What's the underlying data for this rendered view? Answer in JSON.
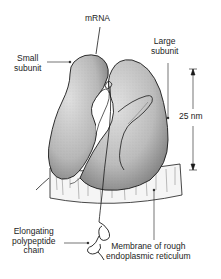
{
  "diagram": {
    "labels": {
      "mrna": "mRNA",
      "small_subunit_line1": "Small",
      "small_subunit_line2": "subunit",
      "large_subunit_line1": "Large",
      "large_subunit_line2": "subunit",
      "scale": "25 nm",
      "polypeptide_line1": "Elongating",
      "polypeptide_line2": "polypeptide",
      "polypeptide_line3": "chain",
      "membrane_line1": "Membrane of rough",
      "membrane_line2": "endoplasmic reticulum"
    },
    "colors": {
      "ink": "#1a1a1a",
      "subunit_fill": "#c9c9c9",
      "subunit_shade": "#8e8e8e",
      "membrane_fill": "#f4f4f4",
      "background": "#ffffff"
    }
  }
}
